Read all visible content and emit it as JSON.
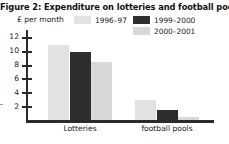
{
  "chart_data": {
    "type": "bar",
    "title": "Figure 2: Expenditure on lotteries and football pools",
    "xlabel": "",
    "ylabel": "£ per month",
    "categories": [
      "Lotteries",
      "football pools"
    ],
    "series": [
      {
        "name": "1996–97",
        "values": [
          10.9,
          2.9
        ],
        "color": "#e2e2e2"
      },
      {
        "name": "1999–2000",
        "values": [
          9.8,
          1.4
        ],
        "color": "#2e2e2e"
      },
      {
        "name": "2000–2001",
        "values": [
          8.4,
          0.5
        ],
        "color": "#d8d8d8"
      }
    ],
    "ylim": [
      0,
      13
    ],
    "yticks": [
      2,
      4,
      6,
      8,
      10,
      12
    ],
    "ytick_labels": [
      "2",
      "4",
      "6",
      "8",
      "10",
      "12"
    ],
    "grid": false,
    "legend_position": "top-right"
  },
  "colors": {
    "axis": "#2b2b2b",
    "text": "#1a1a1a",
    "background": "#ffffff"
  }
}
